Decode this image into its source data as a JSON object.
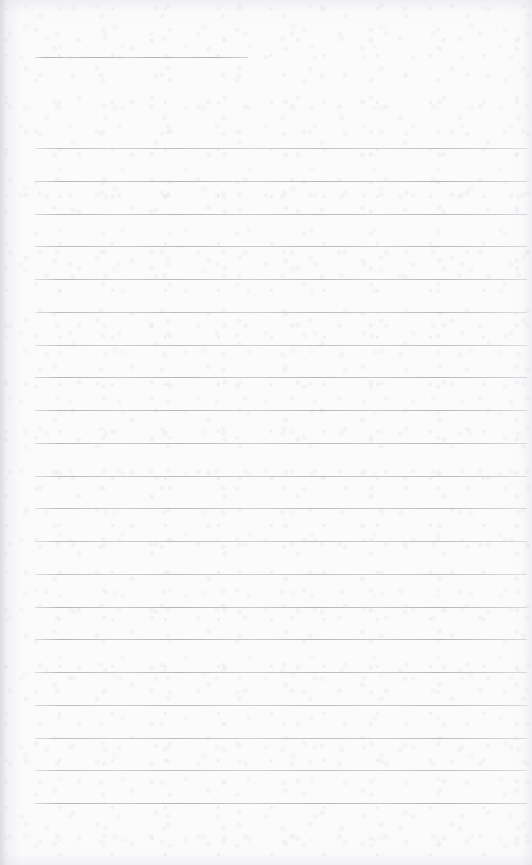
{
  "document": {
    "type": "ruled-paper",
    "description": "Blank lined notepad page",
    "content_text": "",
    "page_width": 532,
    "page_height": 865,
    "background_color": "#fbfbfc",
    "rule_color": "#b3b3b9",
    "rule_thickness_px": 1,
    "rule_spacing_px": 32.7,
    "left_margin_px": 35,
    "right_margin_px": 527,
    "header_rule": {
      "label": "header-rule",
      "y": 57,
      "x_start": 35,
      "x_end": 248,
      "length_px": 213
    },
    "body_rules": {
      "count": 21,
      "first_y": 148,
      "last_y": 803,
      "x_start": 35,
      "x_end": 527,
      "y_positions": [
        148,
        180.8,
        213.5,
        246.3,
        279,
        311.8,
        344.5,
        377.3,
        410,
        442.8,
        475.5,
        508.3,
        541,
        573.8,
        606.5,
        639.3,
        672,
        704.8,
        737.5,
        770.3,
        803
      ]
    },
    "written_lines": []
  }
}
